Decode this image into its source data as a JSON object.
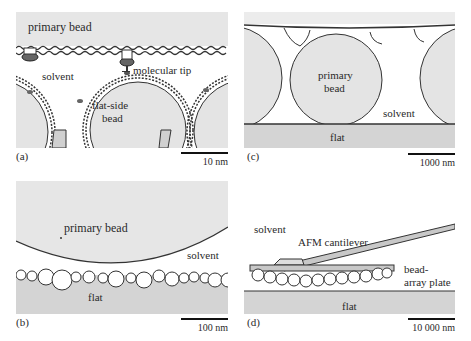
{
  "figure": {
    "panels": {
      "a": {
        "label": "(a)",
        "scale": "10 nm",
        "texts": {
          "primary_bead": "primary bead",
          "solvent": "solvent",
          "molecular_tip": "molecular tip",
          "flat_side_bead_1": "flat-side",
          "flat_side_bead_2": "bead"
        }
      },
      "b": {
        "label": "(b)",
        "scale": "100 nm",
        "texts": {
          "primary_bead": "primary bead",
          "solvent": "solvent",
          "flat": "flat"
        }
      },
      "c": {
        "label": "(c)",
        "scale": "1000 nm",
        "texts": {
          "primary_bead_1": "primary",
          "primary_bead_2": "bead",
          "solvent": "solvent",
          "flat": "flat"
        }
      },
      "d": {
        "label": "(d)",
        "scale": "10 000 nm",
        "texts": {
          "solvent": "solvent",
          "afm_cantilever": "AFM cantilever",
          "bead_array_1": "bead-",
          "bead_array_2": "array plate",
          "flat": "flat"
        }
      }
    },
    "colors": {
      "grey_fill": "#e4e4e4",
      "flat_fill": "#d4d4d4",
      "outline": "#333333",
      "white": "#ffffff"
    }
  }
}
